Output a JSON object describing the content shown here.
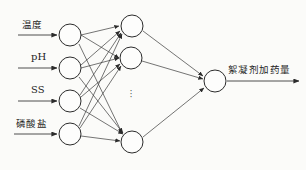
{
  "diagram": {
    "background_color": "#fbfbf9",
    "stroke_color": "#3a3a3a",
    "node_fill": "#fdfdfc",
    "node_radius": 11,
    "ellipsis_symbol": "·"
  },
  "input_layer": {
    "name": "input-layer",
    "count": 4,
    "nodes": [
      {
        "id": "in-1",
        "label": "温度",
        "cx": 70,
        "cy": 35,
        "label_x": 22,
        "label_y": 20,
        "label_kind": "cjk",
        "arrow_x1": 18,
        "arrow_x2": 58,
        "arrow_y": 35
      },
      {
        "id": "in-2",
        "label": "pH",
        "cx": 70,
        "cy": 68,
        "label_x": 31,
        "label_y": 53,
        "label_kind": "lat",
        "arrow_x1": 18,
        "arrow_x2": 58,
        "arrow_y": 68
      },
      {
        "id": "in-3",
        "label": "SS",
        "cx": 70,
        "cy": 101,
        "label_x": 31,
        "label_y": 86,
        "label_kind": "lat",
        "arrow_x1": 18,
        "arrow_x2": 58,
        "arrow_y": 101
      },
      {
        "id": "in-4",
        "label": "磷酸盐",
        "cx": 70,
        "cy": 134,
        "label_x": 16,
        "label_y": 119,
        "label_kind": "cjk",
        "arrow_x1": 14,
        "arrow_x2": 58,
        "arrow_y": 134
      }
    ]
  },
  "hidden_layer": {
    "name": "hidden-layer",
    "visible_count": 3,
    "has_ellipsis": true,
    "ellipsis_x": 127,
    "ellipsis_y": 92,
    "nodes": [
      {
        "id": "hid-1",
        "cx": 132,
        "cy": 26
      },
      {
        "id": "hid-2",
        "cx": 131,
        "cy": 58
      },
      {
        "id": "hid-3",
        "cx": 132,
        "cy": 142
      }
    ]
  },
  "output_layer": {
    "name": "output-layer",
    "count": 1,
    "nodes": [
      {
        "id": "out-1",
        "cx": 215,
        "cy": 81
      }
    ],
    "label": "絮凝剂加药量",
    "label_x": 228,
    "label_y": 66,
    "arrow_x1": 227,
    "arrow_x2": 300,
    "arrow_y": 81
  },
  "edges": {
    "input_to_hidden_label": "fully connected 4x3",
    "hidden_to_output_label": "3 to 1"
  }
}
